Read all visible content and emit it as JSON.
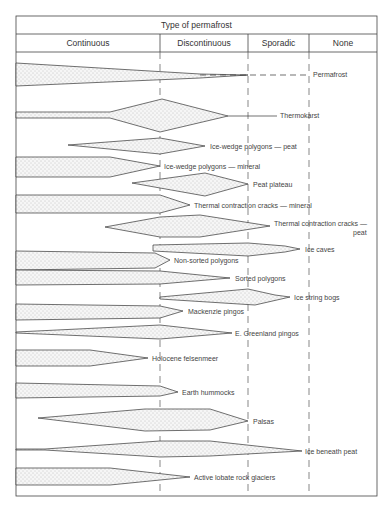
{
  "header": {
    "title": "Type of permafrost",
    "columns": [
      {
        "label": "Continuous",
        "x0": 16,
        "x1": 160
      },
      {
        "label": "Discontinuous",
        "x0": 160,
        "x1": 248
      },
      {
        "label": "Sporadic",
        "x0": 248,
        "x1": 309
      },
      {
        "label": "None",
        "x0": 309,
        "x1": 377
      }
    ]
  },
  "features": [
    {
      "name": "Permafrost",
      "label": "Permafrost"
    },
    {
      "name": "Thermokarst",
      "label": "Thermokarst"
    },
    {
      "name": "Ice-wedge polygons — peat",
      "label": "Ice-wedge polygons — peat"
    },
    {
      "name": "Ice-wedge polygons — mineral",
      "label": "Ice-wedge polygons — mineral"
    },
    {
      "name": "Peat plateau",
      "label": "Peat plateau"
    },
    {
      "name": "Thermal contraction cracks — mineral",
      "label": "Thermal contraction cracks — mineral"
    },
    {
      "name": "Thermal contraction cracks — peat",
      "label": "Thermal contraction cracks —",
      "label2": "peat"
    },
    {
      "name": "Ice caves",
      "label": "Ice caves"
    },
    {
      "name": "Non-sorted polygons",
      "label": "Non-sorted polygons"
    },
    {
      "name": "Sorted polygons",
      "label": "Sorted polygons"
    },
    {
      "name": "Ice string bogs",
      "label": "Ice string bogs"
    },
    {
      "name": "Mackenzie pingos",
      "label": "Mackenzie pingos"
    },
    {
      "name": "E. Greenland pingos",
      "label": "E. Greenland pingos"
    },
    {
      "name": "Holocene felsenmeer",
      "label": "Holocene felsenmeer"
    },
    {
      "name": "Earth hummocks",
      "label": "Earth hummocks"
    },
    {
      "name": "Palsas",
      "label": "Palsas"
    },
    {
      "name": "Ice beneath peat",
      "label": "Ice beneath peat"
    },
    {
      "name": "Active lobate rock glaciers",
      "label": "Active lobate rock glaciers"
    }
  ],
  "colors": {
    "line": "#333333",
    "stipple": "#777777",
    "fill": "#f4f4f4"
  }
}
